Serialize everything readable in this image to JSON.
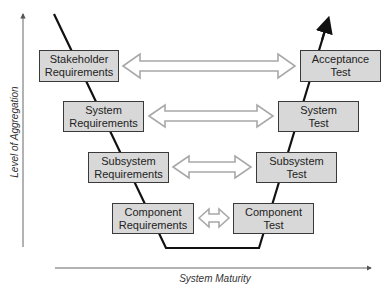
{
  "diagram": {
    "type": "V-model",
    "axes": {
      "y_label": "Level of Aggregation",
      "x_label": "System Maturity"
    },
    "left_side": [
      {
        "line1": "Stakeholder",
        "line2": "Requirements"
      },
      {
        "line1": "System",
        "line2": "Requirements"
      },
      {
        "line1": "Subsystem",
        "line2": "Requirements"
      },
      {
        "line1": "Component",
        "line2": "Requirements"
      }
    ],
    "right_side": [
      {
        "line1": "Acceptance",
        "line2": "Test"
      },
      {
        "line1": "System",
        "line2": "Test"
      },
      {
        "line1": "Subsystem",
        "line2": "Test"
      },
      {
        "line1": "Component",
        "line2": "Test"
      }
    ],
    "connections": [
      {
        "from": "Stakeholder Requirements",
        "to": "Acceptance Test",
        "type": "double-arrow"
      },
      {
        "from": "System Requirements",
        "to": "System Test",
        "type": "double-arrow"
      },
      {
        "from": "Subsystem Requirements",
        "to": "Subsystem Test",
        "type": "double-arrow"
      },
      {
        "from": "Component Requirements",
        "to": "Component Test",
        "type": "double-arrow"
      }
    ],
    "colors": {
      "box_fill": "#d8d8d8",
      "box_border": "#3a3a3a",
      "v_line": "#111111",
      "arrow_outline": "#a8a8a8",
      "axis": "#555555"
    }
  }
}
